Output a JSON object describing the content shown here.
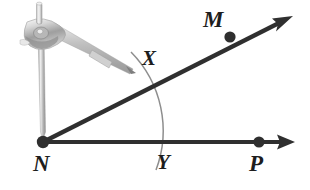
{
  "figure": {
    "background_color": "#ffffff",
    "ink_color": "#2b2b2b",
    "arc_color": "#8e8e8e",
    "compass_color": "#b9b9b9"
  },
  "labels": {
    "m": "M",
    "x": "X",
    "n": "N",
    "y": "Y",
    "p": "P"
  },
  "points": [
    {
      "name": "N",
      "label": "N",
      "x": 43,
      "y": 142,
      "role": "vertex",
      "dot": true
    },
    {
      "name": "M",
      "label": "M",
      "x": 230,
      "y": 37,
      "role": "ray-point",
      "dot": true
    },
    {
      "name": "P",
      "label": "P",
      "x": 259,
      "y": 142,
      "role": "ray-point",
      "dot": true
    },
    {
      "name": "X",
      "label": "X",
      "x": 135,
      "y": 62,
      "role": "arc-intersection",
      "dot": false
    },
    {
      "name": "Y",
      "label": "Y",
      "x": 152,
      "y": 142,
      "role": "arc-intersection",
      "dot": false
    }
  ],
  "rays": [
    {
      "name": "ray-NM",
      "from": "N",
      "through": "M",
      "tip_x": 292,
      "tip_y": 17,
      "arrow": true
    },
    {
      "name": "ray-NP",
      "from": "N",
      "through": "P",
      "tip_x": 295,
      "tip_y": 142,
      "arrow": true
    }
  ],
  "arc": {
    "name": "construction-arc",
    "center": "N",
    "radius": 112,
    "from_point": "X",
    "to_point": "Y",
    "start_x": 131,
    "start_y": 52,
    "end_x": 156,
    "end_y": 170
  },
  "compass": {
    "name": "compass-tool",
    "needle_tip_at": "N",
    "pencil_tip_x": 134,
    "pencil_tip_y": 72,
    "hinge_x": 58,
    "hinge_y": 34
  }
}
